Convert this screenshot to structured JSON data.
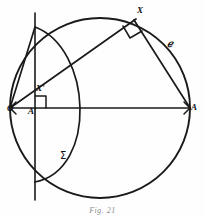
{
  "figure": {
    "caption": "Fig. 21",
    "background_color": "#fefefe",
    "ink_color": "#1a1a1a"
  },
  "labels": {
    "origin": "O",
    "a_prime": "A'",
    "x_prime": "X'",
    "a_point": "A",
    "x_point": "X",
    "circle_name": "ℯ",
    "sigma_name": "Σ"
  },
  "geometry": {
    "circle": {
      "cx": 100,
      "cy": 108,
      "r": 90,
      "name": "ℯ"
    },
    "diameter": {
      "from": [
        10,
        108
      ],
      "to": [
        190,
        108
      ]
    },
    "vertical_line": {
      "x": 35,
      "y_top": 13,
      "y_bottom": 200
    },
    "a_prime_point": [
      35,
      108
    ],
    "x_prime_point": [
      44,
      96
    ],
    "x_point": [
      134,
      20
    ],
    "sigma_arc": {
      "name": "Σ",
      "through": [
        [
          35,
          27
        ],
        [
          108,
          118
        ],
        [
          35,
          182
        ]
      ]
    },
    "right_angles": [
      {
        "at": "A'",
        "vertex": [
          35,
          108
        ],
        "size": 11
      },
      {
        "at": "X",
        "vertex": [
          134,
          20
        ],
        "size": 13
      }
    ],
    "rays": [
      {
        "from": [
          10,
          108
        ],
        "to": [
          134,
          20
        ],
        "label": "OX"
      },
      {
        "from": [
          134,
          20
        ],
        "to": [
          190,
          108
        ],
        "label": "XA"
      },
      {
        "from": [
          10,
          108
        ],
        "to": [
          35,
          27
        ],
        "label": "O to upper vertical"
      }
    ]
  }
}
